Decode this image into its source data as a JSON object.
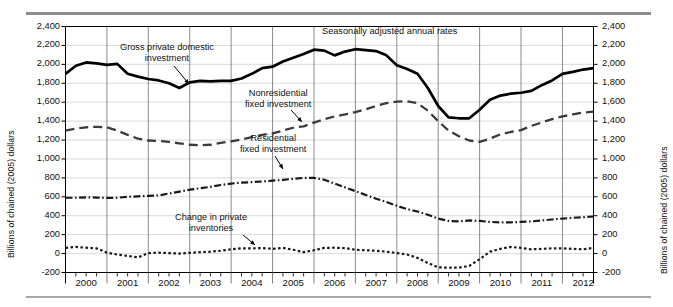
{
  "figure": {
    "y_axis_title_left": "Billions of chained (2005) dollars",
    "y_axis_title_right": "Billions of chained (2005) dollars",
    "note": "Seasonally adjusted annual rates"
  },
  "annotations": [
    {
      "name": "gross-private-domestic-investment",
      "line1": "Gross private domestic",
      "line2": "investment"
    },
    {
      "name": "nonresidential-fixed-investment",
      "line1": "Nonresidential",
      "line2": "fixed investment"
    },
    {
      "name": "residential-fixed-investment",
      "line1": "Residential",
      "line2": "fixed investment"
    },
    {
      "name": "change-in-private-inventories",
      "line1": "Change in private",
      "line2": "inventories"
    }
  ],
  "chart_data": {
    "type": "line",
    "title": "Seasonally adjusted annual rates",
    "xlabel": "",
    "ylabel": "Billions of chained (2005) dollars",
    "ylim": [
      -200,
      2400
    ],
    "ytick_labels": [
      "2,400",
      "2,200",
      "2,000",
      "1,800",
      "1,600",
      "1,400",
      "1,200",
      "1,000",
      "800",
      "600",
      "400",
      "200",
      "0",
      "-200"
    ],
    "ytick_values": [
      2400,
      2200,
      2000,
      1800,
      1600,
      1400,
      1200,
      1000,
      800,
      600,
      400,
      200,
      0,
      -200
    ],
    "grid": true,
    "legend": "inline annotations",
    "xlim": [
      2000.0,
      2012.75
    ],
    "xtick_labels": [
      "2000",
      "2001",
      "2002",
      "2003",
      "2004",
      "2005",
      "2006",
      "2007",
      "2008",
      "2009",
      "2010",
      "2011",
      "2012"
    ],
    "x": [
      2000.0,
      2000.25,
      2000.5,
      2000.75,
      2001.0,
      2001.25,
      2001.5,
      2001.75,
      2002.0,
      2002.25,
      2002.5,
      2002.75,
      2003.0,
      2003.25,
      2003.5,
      2003.75,
      2004.0,
      2004.25,
      2004.5,
      2004.75,
      2005.0,
      2005.25,
      2005.5,
      2005.75,
      2006.0,
      2006.25,
      2006.5,
      2006.75,
      2007.0,
      2007.25,
      2007.5,
      2007.75,
      2008.0,
      2008.25,
      2008.5,
      2008.75,
      2009.0,
      2009.25,
      2009.5,
      2009.75,
      2010.0,
      2010.25,
      2010.5,
      2010.75,
      2011.0,
      2011.25,
      2011.5,
      2011.75,
      2012.0,
      2012.25,
      2012.5,
      2012.75
    ],
    "series": [
      {
        "name": "Gross private domestic investment",
        "style": "solid-thick",
        "color": "#000000",
        "values": [
          1900,
          1985,
          2020,
          2010,
          1995,
          2005,
          1900,
          1870,
          1845,
          1830,
          1800,
          1750,
          1810,
          1825,
          1820,
          1825,
          1825,
          1850,
          1900,
          1960,
          1975,
          2030,
          2070,
          2110,
          2155,
          2145,
          2095,
          2135,
          2160,
          2150,
          2140,
          2095,
          1990,
          1950,
          1900,
          1750,
          1560,
          1440,
          1430,
          1430,
          1520,
          1625,
          1670,
          1690,
          1700,
          1720,
          1780,
          1830,
          1900,
          1920,
          1945,
          1960
        ]
      },
      {
        "name": "Nonresidential fixed investment",
        "style": "dashed",
        "color": "#3b3b3b",
        "values": [
          1300,
          1320,
          1335,
          1340,
          1335,
          1300,
          1255,
          1215,
          1195,
          1190,
          1180,
          1165,
          1150,
          1145,
          1150,
          1170,
          1185,
          1205,
          1230,
          1255,
          1270,
          1300,
          1330,
          1345,
          1385,
          1420,
          1450,
          1470,
          1495,
          1525,
          1560,
          1590,
          1605,
          1610,
          1590,
          1510,
          1400,
          1300,
          1240,
          1195,
          1180,
          1215,
          1260,
          1285,
          1305,
          1350,
          1385,
          1420,
          1450,
          1470,
          1490,
          1500
        ]
      },
      {
        "name": "Residential fixed investment",
        "style": "dash-dot",
        "color": "#1a1a1a",
        "values": [
          590,
          590,
          595,
          592,
          588,
          590,
          600,
          605,
          610,
          615,
          635,
          655,
          675,
          690,
          705,
          725,
          740,
          750,
          755,
          762,
          770,
          780,
          790,
          800,
          800,
          780,
          740,
          700,
          660,
          620,
          580,
          545,
          505,
          470,
          445,
          410,
          370,
          345,
          340,
          350,
          345,
          335,
          330,
          330,
          335,
          340,
          350,
          360,
          370,
          378,
          385,
          392
        ]
      },
      {
        "name": "Change in private inventories",
        "style": "dotted",
        "color": "#1a1a1a",
        "values": [
          60,
          70,
          62,
          55,
          10,
          -10,
          -25,
          -40,
          5,
          10,
          5,
          0,
          8,
          15,
          20,
          30,
          45,
          55,
          55,
          58,
          50,
          60,
          40,
          15,
          35,
          60,
          62,
          58,
          40,
          35,
          30,
          20,
          5,
          -10,
          -45,
          -100,
          -145,
          -150,
          -148,
          -130,
          -60,
          20,
          50,
          70,
          60,
          45,
          50,
          55,
          55,
          50,
          45,
          60
        ]
      }
    ]
  }
}
